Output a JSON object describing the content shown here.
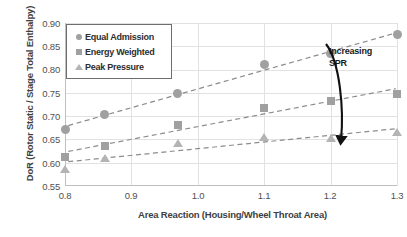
{
  "chart_data": {
    "type": "scatter",
    "title": "",
    "xlabel": "Area Reaction (Housing/Wheel Throat Area)",
    "ylabel": "DoR (Rotor Static / Stage Total Enthalpy)",
    "xlim": [
      0.8,
      1.3
    ],
    "ylim": [
      0.55,
      0.9
    ],
    "xticks": [
      "0.8",
      "0.9",
      "1.0",
      "1.1",
      "1.2",
      "1.3"
    ],
    "yticks": [
      "0.55",
      "0.60",
      "0.65",
      "0.70",
      "0.75",
      "0.80",
      "0.85",
      "0.90"
    ],
    "grid": true,
    "legend_position": "upper-left",
    "x": [
      0.8,
      0.86,
      0.97,
      1.1,
      1.2,
      1.3
    ],
    "series": [
      {
        "name": "Equal Admission",
        "marker": "circle",
        "color": "#a0a0a0",
        "trendline": true,
        "values": [
          0.672,
          0.703,
          0.748,
          0.81,
          0.835,
          0.875
        ]
      },
      {
        "name": "Energy Weighted",
        "marker": "square",
        "color": "#a0a0a0",
        "trendline": true,
        "values": [
          0.612,
          0.636,
          0.682,
          0.718,
          0.733,
          0.747
        ]
      },
      {
        "name": "Peak Pressure",
        "marker": "triangle",
        "color": "#b4b4b4",
        "trendline": true,
        "values": [
          0.587,
          0.61,
          0.643,
          0.655,
          0.654,
          0.665
        ]
      }
    ],
    "annotations": [
      {
        "text": "Increasing SPR",
        "line1": "Increasing",
        "line2": "SPR",
        "color": "#1a1a1a",
        "arrow": "curved-down"
      }
    ]
  },
  "legend": {
    "items": [
      {
        "label": "Equal Admission",
        "marker": "circle"
      },
      {
        "label": "Energy Weighted",
        "marker": "square"
      },
      {
        "label": "Peak Pressure",
        "marker": "triangle"
      }
    ]
  },
  "colors": {
    "marker": "#a0a0a0",
    "trendline": "#8c8c8c",
    "grid": "#e2e2e2",
    "axis": "#bfbfbf",
    "text": "#515151",
    "annotation": "#1a1a1a"
  }
}
